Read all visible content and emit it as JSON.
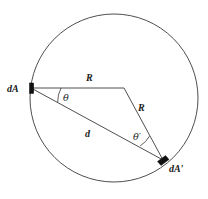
{
  "figure": {
    "name": "two-differential-areas-on-sphere",
    "background_color": "#ffffff",
    "stroke_color": "#3a3a3a",
    "marker_color": "#111111",
    "text_color": "#1a1a1a"
  },
  "labels": {
    "dA": "dA",
    "dA_prime": "dA′",
    "R_first": "R",
    "R_second": "R",
    "d": "d",
    "theta": "θ",
    "theta_prime": "θ′"
  },
  "geometry": {
    "circle": {
      "cx": 114,
      "cy": 98,
      "r": 84
    },
    "point_dA": {
      "x": 31,
      "y": 88
    },
    "point_center": {
      "x": 124,
      "y": 88
    },
    "point_dA_prime": {
      "x": 163,
      "y": 160
    },
    "arc_theta_radius": 30,
    "arc_theta_prime_radius": 26
  },
  "label_positions": {
    "dA": {
      "x": 7,
      "y": 92
    },
    "dA_prime": {
      "x": 169,
      "y": 172
    },
    "R_first": {
      "x": 86,
      "y": 81
    },
    "R_second": {
      "x": 138,
      "y": 111
    },
    "d": {
      "x": 85,
      "y": 137
    },
    "theta": {
      "x": 63,
      "y": 101
    },
    "theta_prime": {
      "x": 133,
      "y": 140
    }
  }
}
